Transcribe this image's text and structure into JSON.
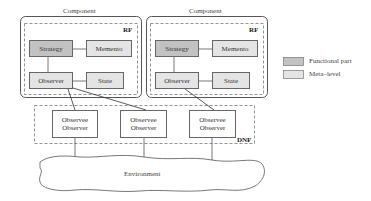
{
  "components": [
    {
      "title": "Component",
      "region_label": "RF",
      "parts": {
        "strategy": "Strategy",
        "memento": "Memento",
        "observer": "Observer",
        "state": "State"
      }
    },
    {
      "title": "Component",
      "region_label": "RF",
      "parts": {
        "strategy": "Strategy",
        "memento": "Memento",
        "observer": "Observer",
        "state": "State"
      }
    }
  ],
  "dnf": {
    "label": "DNF",
    "nodes": [
      {
        "line1": "Observee",
        "line2": "Observer"
      },
      {
        "line1": "Observee",
        "line2": "Observer"
      },
      {
        "line1": "Observee",
        "line2": "Observer"
      }
    ]
  },
  "environment": {
    "label": "Environment"
  },
  "legend": [
    {
      "label": "Functional part",
      "color": "#c2c2c2"
    },
    {
      "label": "Meta–level",
      "color": "#e4e4e4"
    }
  ]
}
